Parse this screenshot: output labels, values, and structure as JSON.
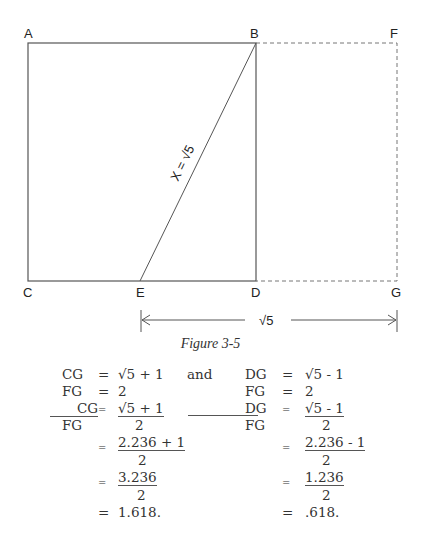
{
  "diagram": {
    "points": {
      "A": "A",
      "B": "B",
      "F": "F",
      "C": "C",
      "E": "E",
      "D": "D",
      "G": "G"
    },
    "diagonal_label": "X = √5",
    "dimension_label": "√5",
    "caption": "Figure 3-5"
  },
  "equations": {
    "left": {
      "r1": {
        "lhs": "CG",
        "eq": "=",
        "rhs": "√5 + 1"
      },
      "r2": {
        "lhs": "FG",
        "eq": "=",
        "rhs": "2"
      },
      "r3": {
        "num": "CG",
        "den": "FG",
        "eq": "=",
        "rnum": "√5 + 1",
        "rden": "2"
      },
      "r4": {
        "eq": "=",
        "rnum": "2.236 + 1",
        "rden": "2"
      },
      "r5": {
        "eq": "=",
        "rnum": "3.236",
        "rden": "2"
      },
      "r6": {
        "eq": "=",
        "val": "1.618."
      }
    },
    "connector": "and",
    "right": {
      "r1": {
        "lhs": "DG",
        "eq": "=",
        "rhs": "√5 - 1"
      },
      "r2": {
        "lhs": "FG",
        "eq": "=",
        "rhs": "2"
      },
      "r3": {
        "num": "DG",
        "den": "FG",
        "eq": "=",
        "rnum": "√5 - 1",
        "rden": "2"
      },
      "r4": {
        "eq": "=",
        "rnum": "2.236 - 1",
        "rden": "2"
      },
      "r5": {
        "eq": "=",
        "rnum": "1.236",
        "rden": "2"
      },
      "r6": {
        "eq": "=",
        "val": ".618."
      }
    }
  }
}
